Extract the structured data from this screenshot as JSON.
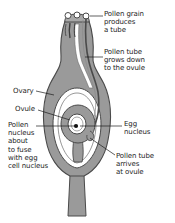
{
  "figure": {
    "type": "diagram",
    "background_color": "#ffffff",
    "ink_color": "#1d1d1d",
    "tissue_fill": "#9a9a9a",
    "tissue_fill_light": "#b3b3b3",
    "tissue_outline": "#4a4a4a",
    "cavity_fill": "#ffffff"
  },
  "labels": [
    {
      "id": "pollen-grain",
      "text": "Pollen grain\nproduces\na tube",
      "side": "right",
      "x": 104,
      "y": 10
    },
    {
      "id": "pollen-tube-grows",
      "text": "Pollen tube\ngrows down\nto the ovule",
      "side": "right",
      "x": 104,
      "y": 48
    },
    {
      "id": "ovary",
      "text": "Ovary",
      "side": "left",
      "x": 13,
      "y": 88
    },
    {
      "id": "ovule",
      "text": "Ovule",
      "side": "left",
      "x": 15,
      "y": 106
    },
    {
      "id": "pollen-nucleus",
      "text": "Pollen\nnucleus\nabout\nto fuse\nwith egg\ncell nucleus",
      "side": "left",
      "x": 8,
      "y": 121
    },
    {
      "id": "egg-nucleus",
      "text": "Egg\nnucleus",
      "side": "right",
      "x": 123,
      "y": 121
    },
    {
      "id": "pollen-tube-arrives",
      "text": "Pollen tube\narrives\nat ovule",
      "side": "right",
      "x": 116,
      "y": 152
    }
  ],
  "parts": [
    {
      "id": "stigma",
      "name": "stigma"
    },
    {
      "id": "pollen-grains",
      "name": "pollen grains",
      "count": 3
    },
    {
      "id": "style",
      "name": "style"
    },
    {
      "id": "pollen-tube",
      "name": "pollen tube"
    },
    {
      "id": "ovary-wall",
      "name": "ovary wall"
    },
    {
      "id": "ovule-body",
      "name": "ovule"
    },
    {
      "id": "embryo-sac",
      "name": "embryo sac"
    },
    {
      "id": "egg-nucleus-dot",
      "name": "egg nucleus"
    },
    {
      "id": "stalk",
      "name": "flower stalk"
    }
  ]
}
